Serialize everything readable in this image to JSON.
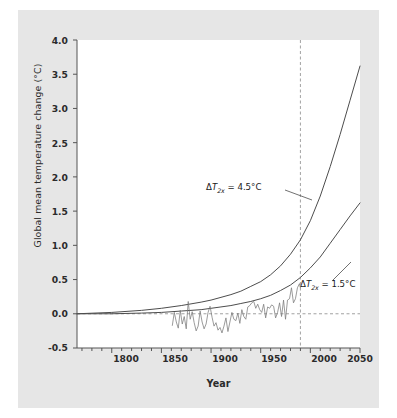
{
  "chart_data": {
    "type": "line",
    "title": "",
    "xlabel": "Year",
    "ylabel": "Global mean temperature change (°C)",
    "xlim": [
      1765,
      2050
    ],
    "ylim": [
      -0.5,
      4.0
    ],
    "xticks": [
      1800,
      1850,
      1900,
      1950,
      2000,
      2050
    ],
    "xtick_labels": [
      "1800",
      "1850",
      "1900",
      "1950",
      "2000",
      "2050"
    ],
    "x_minor_tick_interval": 10,
    "yticks": [
      -0.5,
      0.0,
      0.5,
      1.0,
      1.5,
      2.0,
      2.5,
      3.0,
      3.5,
      4.0
    ],
    "ytick_labels": [
      "-0.5",
      "0.0",
      "0.5",
      "1.0",
      "1.5",
      "2.0",
      "2.5",
      "3.0",
      "3.5",
      "4.0"
    ],
    "grid": false,
    "legend_position": "inline-annotations",
    "reference_lines": [
      {
        "name": "zero-line",
        "orientation": "horizontal",
        "value": 0.0,
        "style": "dashed"
      },
      {
        "name": "present-year-line",
        "orientation": "vertical",
        "value": 1990,
        "style": "dashed"
      }
    ],
    "annotations": [
      {
        "name": "high-sensitivity-label",
        "text": "ΔT2x = 4.5°C",
        "delta": "Δ",
        "symbol": "T",
        "subscript": "2x",
        "value": "4.5°C",
        "x": 1938,
        "y": 1.93
      },
      {
        "name": "low-sensitivity-label",
        "text": "ΔT2x = 1.5°C",
        "delta": "Δ",
        "symbol": "T",
        "subscript": "2x",
        "value": "1.5°C",
        "x": 2000,
        "y": 0.54
      }
    ],
    "series": [
      {
        "name": "ΔT2x = 4.5°C",
        "type": "line",
        "color": "#4d4d4d",
        "x": [
          1765,
          1800,
          1830,
          1850,
          1870,
          1890,
          1900,
          1910,
          1920,
          1930,
          1940,
          1950,
          1960,
          1970,
          1980,
          1990,
          2000,
          2010,
          2020,
          2030,
          2040,
          2050
        ],
        "y": [
          0.0,
          0.02,
          0.05,
          0.08,
          0.12,
          0.17,
          0.2,
          0.24,
          0.28,
          0.33,
          0.4,
          0.47,
          0.57,
          0.7,
          0.87,
          1.08,
          1.36,
          1.72,
          2.15,
          2.62,
          3.12,
          3.62
        ]
      },
      {
        "name": "ΔT2x = 1.5°C",
        "type": "line",
        "color": "#4d4d4d",
        "x": [
          1765,
          1800,
          1830,
          1850,
          1870,
          1890,
          1900,
          1910,
          1920,
          1930,
          1940,
          1950,
          1960,
          1970,
          1980,
          1990,
          2000,
          2010,
          2020,
          2030,
          2040,
          2050
        ],
        "y": [
          0.0,
          0.0,
          0.01,
          0.02,
          0.04,
          0.06,
          0.08,
          0.1,
          0.12,
          0.15,
          0.18,
          0.22,
          0.27,
          0.34,
          0.42,
          0.53,
          0.67,
          0.83,
          1.03,
          1.23,
          1.43,
          1.62
        ]
      },
      {
        "name": "observed-temperature-record",
        "type": "line",
        "color": "#7a7a7a",
        "x": [
          1861,
          1863,
          1865,
          1867,
          1869,
          1871,
          1873,
          1875,
          1877,
          1879,
          1881,
          1883,
          1885,
          1887,
          1889,
          1891,
          1893,
          1895,
          1897,
          1899,
          1901,
          1903,
          1905,
          1907,
          1909,
          1911,
          1913,
          1915,
          1917,
          1919,
          1921,
          1923,
          1925,
          1927,
          1929,
          1931,
          1933,
          1935,
          1937,
          1939,
          1941,
          1943,
          1945,
          1947,
          1949,
          1951,
          1953,
          1955,
          1957,
          1959,
          1961,
          1963,
          1965,
          1967,
          1969,
          1971,
          1973,
          1975,
          1977,
          1979,
          1981,
          1983,
          1985,
          1987,
          1989,
          1990
        ],
        "y": [
          -0.17,
          0.02,
          -0.12,
          -0.21,
          0.05,
          -0.15,
          -0.04,
          -0.22,
          0.18,
          -0.08,
          0.03,
          -0.13,
          -0.25,
          -0.18,
          0.04,
          -0.12,
          -0.22,
          -0.15,
          0.02,
          0.11,
          -0.05,
          -0.18,
          -0.13,
          -0.24,
          -0.2,
          -0.28,
          -0.18,
          -0.06,
          -0.26,
          -0.12,
          0.02,
          -0.08,
          -0.1,
          0.01,
          -0.14,
          0.06,
          -0.04,
          -0.08,
          0.1,
          0.12,
          0.16,
          0.18,
          0.08,
          0.14,
          0.06,
          0.02,
          0.14,
          -0.06,
          0.1,
          0.08,
          0.13,
          0.11,
          -0.06,
          0.02,
          0.16,
          -0.04,
          0.2,
          -0.08,
          0.2,
          0.22,
          0.38,
          0.16,
          0.22,
          0.38,
          0.44,
          0.38
        ]
      }
    ]
  },
  "axis": {
    "y_title": "Global mean temperature change (°C)",
    "x_title": "Year"
  }
}
